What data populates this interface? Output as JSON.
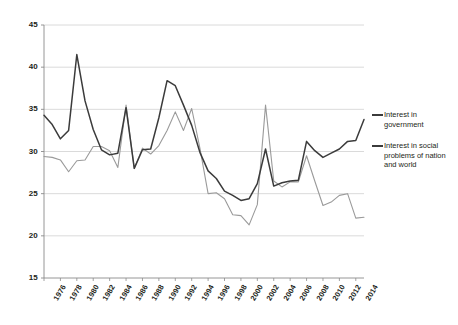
{
  "chart_data": {
    "type": "line",
    "title": "",
    "xlabel": "",
    "ylabel": "",
    "ylim": [
      15,
      45
    ],
    "ytick_values": [
      15,
      20,
      25,
      30,
      35,
      40,
      45
    ],
    "ytick_labels": [
      "15",
      "20",
      "25",
      "30",
      "35",
      "40",
      "45"
    ],
    "grid": true,
    "legend_position": "right",
    "xlim": [
      1976,
      2015
    ],
    "xtick_labels": [
      "1976",
      "1978",
      "1980",
      "1982",
      "1984",
      "1986",
      "1988",
      "1990",
      "1992",
      "1994",
      "1996",
      "1998",
      "2000",
      "2002",
      "2004",
      "2006",
      "2008",
      "2010",
      "2012",
      "2014"
    ],
    "x": [
      1976,
      1977,
      1978,
      1979,
      1980,
      1981,
      1982,
      1983,
      1984,
      1985,
      1986,
      1987,
      1988,
      1989,
      1990,
      1991,
      1992,
      1993,
      1994,
      1995,
      1996,
      1997,
      1998,
      1999,
      2000,
      2001,
      2002,
      2003,
      2004,
      2005,
      2006,
      2007,
      2008,
      2009,
      2010,
      2011,
      2012,
      2013,
      2014,
      2015
    ],
    "series": [
      {
        "name": "Interest in government",
        "color": "#3b3b3b",
        "values": [
          34.3,
          33.2,
          31.5,
          32.5,
          41.5,
          36.0,
          32.6,
          30.2,
          29.6,
          29.8,
          35.2,
          28.0,
          30.2,
          30.3,
          34.0,
          38.4,
          37.8,
          35.5,
          33.1,
          29.9,
          27.7,
          26.8,
          25.3,
          24.8,
          24.2,
          24.4,
          26.2,
          30.3,
          25.9,
          26.3,
          26.5,
          26.6,
          31.2,
          30.1,
          29.3,
          29.8,
          30.3,
          31.2,
          31.3,
          33.8
        ]
      },
      {
        "name": "Interest in social problems of nation and world",
        "color": "#9a9a9a",
        "values": [
          29.4,
          29.3,
          29.0,
          27.6,
          28.9,
          29.0,
          30.6,
          30.6,
          30.1,
          28.1,
          35.5,
          28.0,
          30.4,
          29.7,
          30.7,
          32.5,
          34.7,
          32.5,
          35.1,
          30.4,
          25.0,
          25.1,
          24.4,
          22.5,
          22.4,
          21.3,
          23.7,
          35.5,
          26.5,
          25.8,
          26.4,
          26.4,
          29.5,
          26.5,
          23.6,
          24.0,
          24.8,
          25.0,
          22.1,
          22.2
        ]
      }
    ]
  },
  "legend": {
    "entries": [
      {
        "label": "Interest in government"
      },
      {
        "label": "Interest in social problems of nation and world"
      }
    ]
  }
}
